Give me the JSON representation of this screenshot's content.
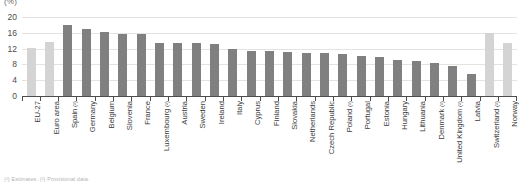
{
  "unit_label": "(%)",
  "footnote": "(¹) Estimates. (²) Provisional data.",
  "colors": {
    "aggregate_bar": "#d4d4d4",
    "member_state_bar": "#808080",
    "non_member_bar": "#d4d4d4",
    "gridline": "#e6e2dd",
    "axis": "#4d4d4d",
    "text": "#3c3c3c"
  },
  "chart_data": {
    "type": "bar",
    "title": "",
    "subtitle": "",
    "xlabel": "",
    "ylabel": "",
    "unit": "%",
    "ylim": [
      0,
      20
    ],
    "yticks": [
      0,
      4,
      8,
      12,
      16,
      20
    ],
    "grid": true,
    "legend_position": "none",
    "categories": [
      "EU-27",
      "Euro area",
      "Spain (²)",
      "Germany",
      "Belgium",
      "Slovenia",
      "France",
      "Luxembourg (²)",
      "Austria",
      "Sweden",
      "Ireland",
      "Italy",
      "Cyprus",
      "Finland",
      "Slovakia",
      "Netherlands",
      "Czech Republic",
      "Poland (²)",
      "Portugal",
      "Estonia",
      "Hungary",
      "Lithuania",
      "Denmark (²)",
      "United Kingdom (²)",
      "Latvia",
      "Switzerland (²)",
      "Norway"
    ],
    "category_labels": [
      {
        "name": "EU-27",
        "note": ""
      },
      {
        "name": "Euro area",
        "note": ""
      },
      {
        "name": "Spain",
        "note": "(²)"
      },
      {
        "name": "Germany",
        "note": ""
      },
      {
        "name": "Belgium",
        "note": ""
      },
      {
        "name": "Slovenia",
        "note": ""
      },
      {
        "name": "France",
        "note": ""
      },
      {
        "name": "Luxembourg",
        "note": "(²)"
      },
      {
        "name": "Austria",
        "note": ""
      },
      {
        "name": "Sweden",
        "note": ""
      },
      {
        "name": "Ireland",
        "note": ""
      },
      {
        "name": "Italy",
        "note": ""
      },
      {
        "name": "Cyprus",
        "note": ""
      },
      {
        "name": "Finland",
        "note": ""
      },
      {
        "name": "Slovakia",
        "note": ""
      },
      {
        "name": "Netherlands",
        "note": ""
      },
      {
        "name": "Czech Republic",
        "note": ""
      },
      {
        "name": "Poland",
        "note": "(²)"
      },
      {
        "name": "Portugal",
        "note": ""
      },
      {
        "name": "Estonia",
        "note": ""
      },
      {
        "name": "Hungary",
        "note": ""
      },
      {
        "name": "Lithuania",
        "note": ""
      },
      {
        "name": "Denmark",
        "note": "(²)"
      },
      {
        "name": "United Kingdom",
        "note": "(²)"
      },
      {
        "name": "Latvia",
        "note": ""
      },
      {
        "name": "Switzerland",
        "note": "(²)"
      },
      {
        "name": "Norway",
        "note": ""
      }
    ],
    "values": [
      12.2,
      13.6,
      18.0,
      17.0,
      16.1,
      15.8,
      15.6,
      13.4,
      13.4,
      13.3,
      13.2,
      11.9,
      11.4,
      11.3,
      11.2,
      10.9,
      10.8,
      10.6,
      10.2,
      9.9,
      9.2,
      8.9,
      8.4,
      7.5,
      5.6,
      16.0,
      13.4
    ],
    "series_groups": [
      {
        "name": "EU aggregate",
        "indices": [
          0,
          1
        ],
        "color": "#d4d4d4"
      },
      {
        "name": "Member States",
        "indices": [
          2,
          3,
          4,
          5,
          6,
          7,
          8,
          9,
          10,
          11,
          12,
          13,
          14,
          15,
          16,
          17,
          18,
          19,
          20,
          21,
          22,
          23,
          24
        ],
        "color": "#808080"
      },
      {
        "name": "Non-member countries",
        "indices": [
          25,
          26
        ],
        "color": "#d4d4d4"
      }
    ]
  }
}
